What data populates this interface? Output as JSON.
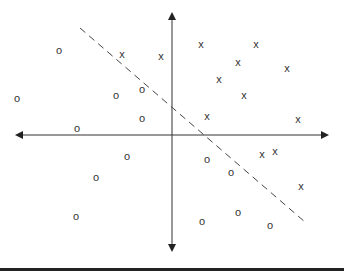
{
  "chart_data": {
    "type": "scatter",
    "title": "",
    "xlabel": "",
    "ylabel": "",
    "grid": false,
    "legend": null,
    "axes": {
      "origin_px": [
        172,
        135
      ],
      "x_axis_px": [
        17,
        327
      ],
      "y_axis_px": [
        14,
        250
      ],
      "arrowheads": "both ends"
    },
    "series": [
      {
        "name": "o",
        "symbol": "o",
        "points_px": [
          [
            59,
            50
          ],
          [
            17,
            98
          ],
          [
            116,
            95
          ],
          [
            142,
            89
          ],
          [
            77,
            128
          ],
          [
            142,
            118
          ],
          [
            127,
            156
          ],
          [
            96,
            177
          ],
          [
            76,
            216
          ],
          [
            207,
            159
          ],
          [
            231,
            172
          ],
          [
            238,
            212
          ],
          [
            202,
            221
          ],
          [
            270,
            225
          ]
        ]
      },
      {
        "name": "x",
        "symbol": "x",
        "points_px": [
          [
            122,
            54
          ],
          [
            161,
            56
          ],
          [
            201,
            44
          ],
          [
            256,
            44
          ],
          [
            238,
            62
          ],
          [
            219,
            79
          ],
          [
            287,
            68
          ],
          [
            244,
            95
          ],
          [
            207,
            116
          ],
          [
            298,
            119
          ],
          [
            262,
            154
          ],
          [
            275,
            151
          ],
          [
            301,
            186
          ]
        ]
      }
    ],
    "decision_boundary": {
      "style": "dashed",
      "from_px": [
        80,
        28
      ],
      "to_px": [
        305,
        222
      ]
    }
  },
  "colors": {
    "axis": "#333333",
    "marker": "#333333",
    "boundary": "#444444",
    "rule": "#222222"
  },
  "labels": {
    "o": "o",
    "x": "x"
  }
}
